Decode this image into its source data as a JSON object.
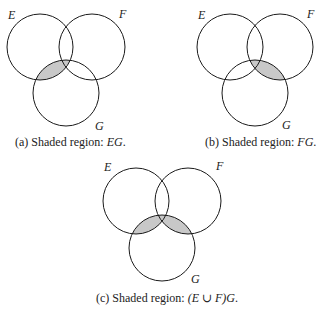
{
  "colors": {
    "stroke": "#1a1a1a",
    "shade": "#c8c8c8",
    "background": "#ffffff"
  },
  "diagrams": [
    {
      "id": "a",
      "labels": {
        "E": "E",
        "F": "F",
        "G": "G"
      },
      "caption": {
        "prefix": "(a) Shaded region: ",
        "expr": "EG",
        "suffix": "."
      },
      "shaded": "E ∩ G"
    },
    {
      "id": "b",
      "labels": {
        "E": "E",
        "F": "F",
        "G": "G"
      },
      "caption": {
        "prefix": "(b) Shaded region: ",
        "expr": "FG",
        "suffix": "."
      },
      "shaded": "F ∩ G"
    },
    {
      "id": "c",
      "labels": {
        "E": "E",
        "F": "F",
        "G": "G"
      },
      "caption": {
        "prefix": "(c) Shaded region: ",
        "expr": "(E ∪ F)G",
        "suffix": "."
      },
      "shaded": "(E ∪ F) ∩ G"
    }
  ]
}
